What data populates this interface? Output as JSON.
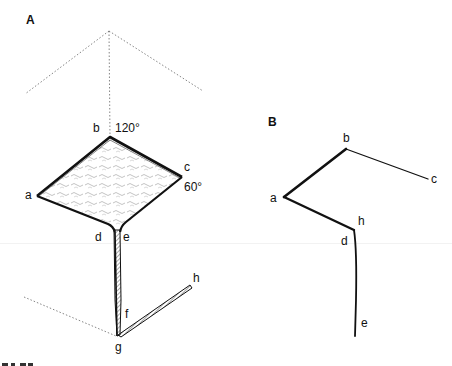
{
  "figure": {
    "panels": [
      {
        "id": "A",
        "label": "A",
        "points": {
          "a": "a",
          "b": "b",
          "c": "c",
          "d": "d",
          "e": "e",
          "f": "f",
          "g": "g",
          "h": "h"
        },
        "angles": {
          "top": "120°",
          "right": "60°"
        },
        "description": "Textured rhomboid surface a-b-c with a thin tapering stalk d-e down to g, then a hatched ribbon g-f-h; dotted construction lines from above b and to the lower left of g"
      },
      {
        "id": "B",
        "label": "B",
        "points": {
          "a": "a",
          "b": "b",
          "c": "c",
          "d": "d",
          "h": "h",
          "e": "e"
        },
        "description": "Line-only edge view: c-b-a-h/d then down to e"
      }
    ],
    "caption_partial": "..."
  }
}
